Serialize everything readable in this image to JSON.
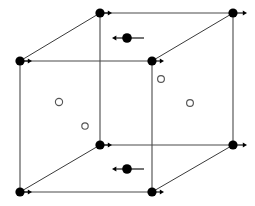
{
  "figure": {
    "title": "Cubic unit cell with lattice-site atoms, interstitial sites and arrow-marked displaced atoms",
    "width": 255,
    "height": 206,
    "background_color": "#ffffff",
    "line_color": "#4a4a4a",
    "edge_color": "#3a3a3a",
    "node_color": "#000000",
    "open_circle_stroke": "#555555",
    "open_circle_fill": "#ffffff",
    "arrow_color": "#000000"
  },
  "geometry": {
    "cube": {
      "front_face": {
        "top_left": {
          "x": 20,
          "y": 61
        },
        "top_right": {
          "x": 152,
          "y": 61
        },
        "bottom_right": {
          "x": 152,
          "y": 192
        },
        "bottom_left": {
          "x": 20,
          "y": 192
        }
      },
      "back_face": {
        "top_left": {
          "x": 100,
          "y": 13
        },
        "top_right": {
          "x": 233,
          "y": 13
        },
        "bottom_right": {
          "x": 233,
          "y": 145
        },
        "bottom_left": {
          "x": 100,
          "y": 145
        }
      }
    }
  },
  "nodes": [
    {
      "id": "back-top-left",
      "label": "lattice-site-atom",
      "x": 100,
      "y": 13,
      "r": 4.6,
      "arrow": "right",
      "arrow_length": 12
    },
    {
      "id": "back-top-right",
      "label": "lattice-site-atom",
      "x": 233,
      "y": 13,
      "r": 4.6,
      "arrow": "right",
      "arrow_length": 14
    },
    {
      "id": "front-top-left",
      "label": "lattice-site-atom",
      "x": 20,
      "y": 61,
      "r": 4.6,
      "arrow": "right",
      "arrow_length": 12
    },
    {
      "id": "front-top-right",
      "label": "lattice-site-atom",
      "x": 152,
      "y": 61,
      "r": 4.6,
      "arrow": "right",
      "arrow_length": 12
    },
    {
      "id": "back-bottom-left",
      "label": "lattice-site-atom",
      "x": 100,
      "y": 145,
      "r": 4.6,
      "arrow": "right",
      "arrow_length": 12
    },
    {
      "id": "back-bottom-right",
      "label": "lattice-site-atom",
      "x": 233,
      "y": 145,
      "r": 4.6,
      "arrow": "right",
      "arrow_length": 14
    },
    {
      "id": "front-bottom-left",
      "label": "lattice-site-atom",
      "x": 20,
      "y": 192,
      "r": 4.6,
      "arrow": "right",
      "arrow_length": 12
    },
    {
      "id": "front-bottom-right",
      "label": "lattice-site-atom",
      "x": 152,
      "y": 192,
      "r": 4.6,
      "arrow": "right",
      "arrow_length": 12
    }
  ],
  "face_center_atoms": [
    {
      "id": "top-face-atom",
      "label": "displaced-atom",
      "x": 127,
      "y": 38,
      "r": 4.8,
      "arrow": "left",
      "tail_right": 17,
      "tail_left": 15
    },
    {
      "id": "bottom-face-atom",
      "label": "displaced-atom",
      "x": 127,
      "y": 169,
      "r": 4.8,
      "arrow": "left",
      "tail_right": 17,
      "tail_left": 15
    }
  ],
  "interstitials": [
    {
      "id": "interstitial-1",
      "label": "interstitial-site",
      "x": 59,
      "y": 102,
      "r": 3.6
    },
    {
      "id": "interstitial-2",
      "label": "interstitial-site",
      "x": 85,
      "y": 126,
      "r": 3.2
    },
    {
      "id": "interstitial-3",
      "label": "interstitial-site",
      "x": 161,
      "y": 79,
      "r": 3.4
    },
    {
      "id": "interstitial-4",
      "label": "interstitial-site",
      "x": 190,
      "y": 103,
      "r": 3.4
    }
  ],
  "edges": [
    {
      "id": "edge-back-top",
      "from": [
        100,
        13
      ],
      "to": [
        233,
        13
      ],
      "kind": "back"
    },
    {
      "id": "edge-back-right",
      "from": [
        233,
        13
      ],
      "to": [
        233,
        145
      ],
      "kind": "back"
    },
    {
      "id": "edge-back-bottom",
      "from": [
        100,
        145
      ],
      "to": [
        233,
        145
      ],
      "kind": "back"
    },
    {
      "id": "edge-back-left",
      "from": [
        100,
        13
      ],
      "to": [
        100,
        145
      ],
      "kind": "back"
    },
    {
      "id": "edge-front-top",
      "from": [
        20,
        61
      ],
      "to": [
        152,
        61
      ],
      "kind": "front"
    },
    {
      "id": "edge-front-right",
      "from": [
        152,
        61
      ],
      "to": [
        152,
        192
      ],
      "kind": "front"
    },
    {
      "id": "edge-front-bottom",
      "from": [
        20,
        192
      ],
      "to": [
        152,
        192
      ],
      "kind": "front"
    },
    {
      "id": "edge-front-left",
      "from": [
        20,
        61
      ],
      "to": [
        20,
        192
      ],
      "kind": "front"
    },
    {
      "id": "edge-diag-top-left",
      "from": [
        20,
        61
      ],
      "to": [
        100,
        13
      ],
      "kind": "depth"
    },
    {
      "id": "edge-diag-top-right",
      "from": [
        152,
        61
      ],
      "to": [
        233,
        13
      ],
      "kind": "depth"
    },
    {
      "id": "edge-diag-bot-left",
      "from": [
        20,
        192
      ],
      "to": [
        100,
        145
      ],
      "kind": "depth"
    },
    {
      "id": "edge-diag-bot-right",
      "from": [
        152,
        192
      ],
      "to": [
        233,
        145
      ],
      "kind": "depth"
    }
  ]
}
